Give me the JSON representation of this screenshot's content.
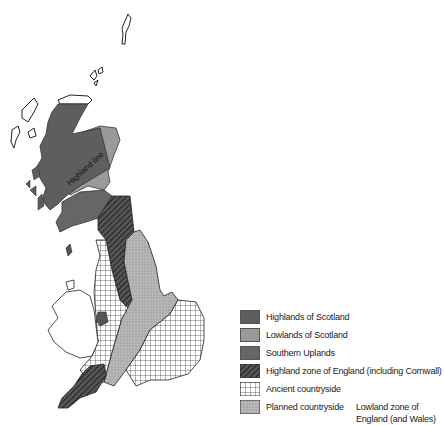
{
  "figure": {
    "map_label": "Highland line",
    "colors": {
      "highlands_scotland": "#5e5e5e",
      "lowlands_scotland": "#9a9a9a",
      "southern_uplands": "#666666",
      "highland_england": "#3a3a3a",
      "ancient_countryside": "#ffffff",
      "planned_countryside": "#b5b5b5"
    }
  },
  "legend": {
    "items": [
      {
        "label": "Highlands of Scotland",
        "pattern": "solid-dark"
      },
      {
        "label": "Lowlands of Scotland",
        "pattern": "solid-light"
      },
      {
        "label": "Southern Uplands",
        "pattern": "solid-dark"
      },
      {
        "label": "Highland zone of England (including Cornwall)",
        "pattern": "diagonal-hatch"
      },
      {
        "label": "Ancient countryside",
        "pattern": "grid"
      },
      {
        "label": "Planned countryside",
        "pattern": "stipple"
      }
    ],
    "group_note_line1": "Lowland zone of",
    "group_note_line2": "England (and Wales)"
  }
}
